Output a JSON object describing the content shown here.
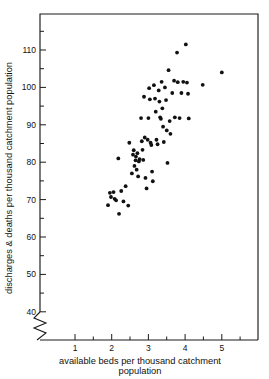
{
  "chart_data": {
    "type": "scatter",
    "title": "",
    "xlabel": "available beds per thousand catchment population",
    "ylabel": "discharges & deaths per thousand catchment population",
    "xlabel_line1": "available beds per thousand  catchment",
    "xlabel_line2": "population",
    "xlim": [
      0.55,
      5.5
    ],
    "ylim": [
      38,
      115
    ],
    "y_axis_break": true,
    "y_break_label": "40",
    "grid": false,
    "legend": null,
    "x_ticks_major": [
      1,
      2,
      3,
      4,
      5
    ],
    "x_tick_labels": [
      "1",
      "2",
      "3",
      "4",
      "5"
    ],
    "y_ticks_major": [
      40,
      50,
      60,
      70,
      80,
      90,
      100,
      110
    ],
    "y_tick_labels": [
      "40",
      "50",
      "60",
      "70",
      "80",
      "90",
      "100",
      "110"
    ],
    "y_ticks_minor": [
      45,
      55,
      65,
      75,
      85,
      95,
      105,
      115
    ],
    "marker": "filled-circle",
    "marker_color": "#111111",
    "n_points": 77,
    "points": [
      [
        1.9,
        68.5
      ],
      [
        1.95,
        71.8
      ],
      [
        1.98,
        70.7
      ],
      [
        2.05,
        72.0
      ],
      [
        2.08,
        70.2
      ],
      [
        2.12,
        69.8
      ],
      [
        2.18,
        81.0
      ],
      [
        2.2,
        66.2
      ],
      [
        2.26,
        72.3
      ],
      [
        2.32,
        69.5
      ],
      [
        2.38,
        73.6
      ],
      [
        2.45,
        68.4
      ],
      [
        2.48,
        85.2
      ],
      [
        2.55,
        77.0
      ],
      [
        2.58,
        82.0
      ],
      [
        2.6,
        83.2
      ],
      [
        2.62,
        79.0
      ],
      [
        2.65,
        80.5
      ],
      [
        2.66,
        81.5
      ],
      [
        2.68,
        78.0
      ],
      [
        2.7,
        82.4
      ],
      [
        2.72,
        76.2
      ],
      [
        2.74,
        80.2
      ],
      [
        2.76,
        80.8
      ],
      [
        2.8,
        91.8
      ],
      [
        2.82,
        85.6
      ],
      [
        2.84,
        83.3
      ],
      [
        2.86,
        80.6
      ],
      [
        2.88,
        97.5
      ],
      [
        2.9,
        86.6
      ],
      [
        2.92,
        75.8
      ],
      [
        2.95,
        73.0
      ],
      [
        2.98,
        86.0
      ],
      [
        3.0,
        91.8
      ],
      [
        3.02,
        99.8
      ],
      [
        3.04,
        96.8
      ],
      [
        3.06,
        85.2
      ],
      [
        3.08,
        84.6
      ],
      [
        3.1,
        77.5
      ],
      [
        3.12,
        74.9
      ],
      [
        3.15,
        100.6
      ],
      [
        3.18,
        97.0
      ],
      [
        3.2,
        93.5
      ],
      [
        3.22,
        86.0
      ],
      [
        3.25,
        84.8
      ],
      [
        3.28,
        99.2
      ],
      [
        3.3,
        96.2
      ],
      [
        3.32,
        92.0
      ],
      [
        3.34,
        91.6
      ],
      [
        3.36,
        101.5
      ],
      [
        3.38,
        94.4
      ],
      [
        3.4,
        89.5
      ],
      [
        3.42,
        85.4
      ],
      [
        3.45,
        100.0
      ],
      [
        3.48,
        96.6
      ],
      [
        3.5,
        88.5
      ],
      [
        3.52,
        79.8
      ],
      [
        3.55,
        104.6
      ],
      [
        3.58,
        91.0
      ],
      [
        3.6,
        87.6
      ],
      [
        3.65,
        98.5
      ],
      [
        3.7,
        101.8
      ],
      [
        3.72,
        92.0
      ],
      [
        3.78,
        109.3
      ],
      [
        3.8,
        101.4
      ],
      [
        3.85,
        91.8
      ],
      [
        3.9,
        98.5
      ],
      [
        3.95,
        101.5
      ],
      [
        4.02,
        111.5
      ],
      [
        4.05,
        101.3
      ],
      [
        4.08,
        98.3
      ],
      [
        4.1,
        91.7
      ],
      [
        4.48,
        100.7
      ],
      [
        5.0,
        104.0
      ]
    ]
  },
  "axes": {
    "x_axis_name": "x-axis",
    "y_axis_name": "y-axis"
  }
}
